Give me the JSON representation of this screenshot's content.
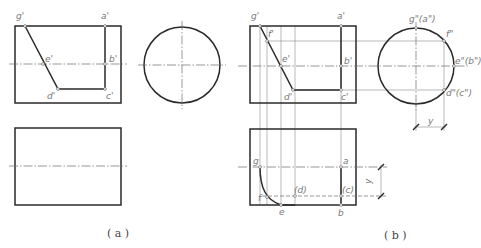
{
  "figure_a": {
    "caption": "( a )",
    "front_view": {
      "rect": {
        "x": 15,
        "y": 26,
        "w": 106,
        "h": 77
      },
      "centerline_y": 64,
      "cut_path": [
        [
          25,
          26
        ],
        [
          58,
          89
        ],
        [
          105,
          89
        ],
        [
          105,
          26
        ]
      ],
      "points": [
        {
          "id": "g",
          "label": "g'",
          "x": 25,
          "y": 26,
          "lx": 16,
          "ly": 19
        },
        {
          "id": "a",
          "label": "a'",
          "x": 105,
          "y": 26,
          "lx": 101,
          "ly": 19
        },
        {
          "id": "e",
          "label": "e'",
          "x": 43,
          "y": 64,
          "lx": 45,
          "ly": 62
        },
        {
          "id": "b",
          "label": "b'",
          "x": 105,
          "y": 64,
          "lx": 109,
          "ly": 62
        },
        {
          "id": "d",
          "label": "d'",
          "x": 58,
          "y": 89,
          "lx": 47,
          "ly": 99
        },
        {
          "id": "c",
          "label": "c'",
          "x": 105,
          "y": 89,
          "lx": 106,
          "ly": 99
        }
      ]
    },
    "side_view": {
      "cx": 182,
      "cy": 65,
      "r": 38
    },
    "top_view": {
      "rect": {
        "x": 15,
        "y": 128,
        "w": 106,
        "h": 77
      },
      "centerline_y": 166
    }
  },
  "figure_b": {
    "caption": "( b )",
    "front_view": {
      "rect": {
        "x": 250,
        "y": 26,
        "w": 106,
        "h": 77
      },
      "centerline_y": 66,
      "cut_path": [
        [
          260,
          26
        ],
        [
          293,
          90
        ],
        [
          341,
          90
        ],
        [
          341,
          26
        ]
      ],
      "points": [
        {
          "id": "g",
          "label": "g'",
          "x": 260,
          "y": 26,
          "lx": 251,
          "ly": 19
        },
        {
          "id": "a",
          "label": "a'",
          "x": 341,
          "y": 26,
          "lx": 337,
          "ly": 19
        },
        {
          "id": "f",
          "label": "f'",
          "x": 267,
          "y": 41,
          "lx": 268,
          "ly": 37
        },
        {
          "id": "e",
          "label": "e'",
          "x": 281,
          "y": 66,
          "lx": 282,
          "ly": 62
        },
        {
          "id": "b",
          "label": "b'",
          "x": 341,
          "y": 66,
          "lx": 344,
          "ly": 64
        },
        {
          "id": "d",
          "label": "d'",
          "x": 293,
          "y": 90,
          "lx": 284,
          "ly": 100
        },
        {
          "id": "c",
          "label": "c'",
          "x": 341,
          "y": 90,
          "lx": 341,
          "ly": 100
        }
      ]
    },
    "side_view": {
      "cx": 416,
      "cy": 66,
      "r": 38,
      "points": [
        {
          "id": "g",
          "label": "g\"(a\")",
          "x": 416,
          "y": 28,
          "lx": 409,
          "ly": 22
        },
        {
          "id": "f",
          "label": "f\"",
          "x": 444,
          "y": 41,
          "lx": 446,
          "ly": 37
        },
        {
          "id": "e",
          "label": "e\"(b\")",
          "x": 454,
          "y": 66,
          "lx": 455,
          "ly": 64
        },
        {
          "id": "d",
          "label": "d\"(c\")",
          "x": 444,
          "y": 90,
          "lx": 446,
          "ly": 96
        }
      ],
      "dimension": {
        "label": "y",
        "x1": 416,
        "x2": 444,
        "y": 127,
        "lx": 428,
        "ly": 124
      }
    },
    "top_view": {
      "rect": {
        "x": 250,
        "y": 129,
        "w": 106,
        "h": 76
      },
      "centerline_y": 167,
      "hidden_y": 196,
      "curve": "M260,167 C260,188 266,200 281,205",
      "points": [
        {
          "id": "g",
          "label": "g",
          "x": 260,
          "y": 167,
          "lx": 253,
          "ly": 164
        },
        {
          "id": "a",
          "label": "a",
          "x": 341,
          "y": 167,
          "lx": 343,
          "ly": 164
        },
        {
          "id": "f",
          "label": "f",
          "x": 267,
          "y": 197,
          "lx": 258,
          "ly": 201
        },
        {
          "id": "d",
          "label": "(d)",
          "x": 295,
          "y": 196,
          "lx": 294,
          "ly": 193
        },
        {
          "id": "c",
          "label": "(c)",
          "x": 341,
          "y": 196,
          "lx": 342,
          "ly": 193
        },
        {
          "id": "e",
          "label": "e",
          "x": 281,
          "y": 205,
          "lx": 279,
          "ly": 215
        },
        {
          "id": "b",
          "label": "b",
          "x": 341,
          "y": 205,
          "lx": 338,
          "ly": 216
        }
      ],
      "dimension": {
        "label": "y",
        "x": 381,
        "y1": 167,
        "y2": 196,
        "lx": 371,
        "ly": 184
      }
    },
    "projection_x": [
      260,
      267,
      281,
      295,
      341
    ]
  }
}
